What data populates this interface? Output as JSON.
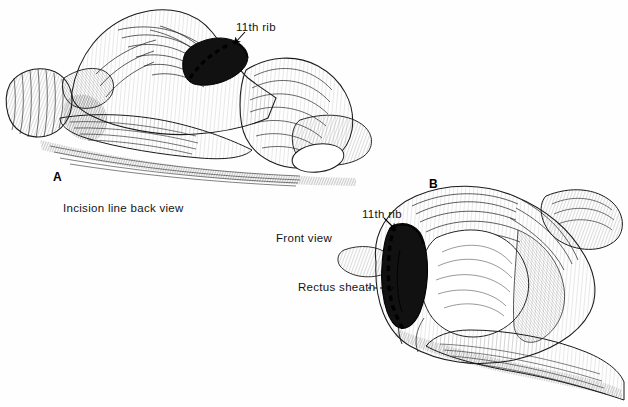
{
  "figure": {
    "type": "medical-line-illustration",
    "background_color": "#fefefe",
    "ink_color": "#1a1a1a",
    "panels": [
      {
        "letter": "A",
        "caption": "Incision line back view",
        "view": "back view, patient prone",
        "annotations": [
          {
            "label": "11th rib",
            "leader": "arrow"
          }
        ]
      },
      {
        "letter": "B",
        "caption": "Front view",
        "view": "front view, patient lateral",
        "annotations": [
          {
            "label": "11th rib",
            "leader": "arrow"
          },
          {
            "label": "Rectus sheath",
            "leader": "dashed-line"
          }
        ]
      }
    ],
    "labels": {
      "rib_a": "11th rib",
      "incision_back": "Incision line back view",
      "front_view": "Front view",
      "rib_b": "11th rib",
      "rectus_sheath": "Rectus sheath",
      "panel_a": "A",
      "panel_b": "B"
    }
  }
}
